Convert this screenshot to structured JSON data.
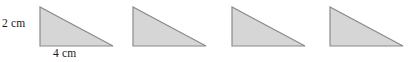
{
  "figure": {
    "background_color": "#ffffff",
    "width": 417,
    "height": 62,
    "shape_count": 4,
    "shape_name": "right triangle",
    "fill_color": "#d6d6d6",
    "stroke_color": "#8a8a8a",
    "text_color": "#1a1a1a"
  },
  "labels": {
    "height": "2 cm",
    "base": "4 cm"
  },
  "chart_data": {
    "type": "diagram",
    "title": "",
    "shapes": [
      {
        "index": 1,
        "kind": "right-triangle",
        "right_angle_corner": "bottom-left",
        "x": 40,
        "y": 7,
        "width": 73,
        "height": 39,
        "labeled": true,
        "height_label": "2 cm",
        "base_label": "4 cm"
      },
      {
        "index": 2,
        "kind": "right-triangle",
        "right_angle_corner": "bottom-left",
        "x": 133,
        "y": 7,
        "width": 73,
        "height": 39,
        "labeled": false,
        "height_label": "",
        "base_label": ""
      },
      {
        "index": 3,
        "kind": "right-triangle",
        "right_angle_corner": "bottom-left",
        "x": 232,
        "y": 7,
        "width": 73,
        "height": 39,
        "labeled": false,
        "height_label": "",
        "base_label": ""
      },
      {
        "index": 4,
        "kind": "right-triangle",
        "right_angle_corner": "bottom-left",
        "x": 330,
        "y": 7,
        "width": 73,
        "height": 39,
        "labeled": false,
        "height_label": "",
        "base_label": ""
      }
    ]
  }
}
